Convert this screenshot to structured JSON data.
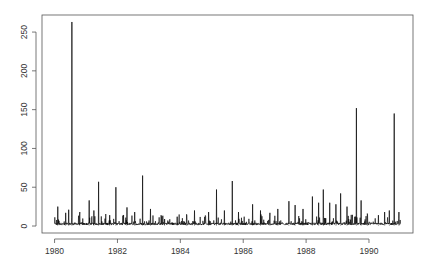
{
  "chart_data": {
    "type": "line",
    "title": "",
    "xlabel": "",
    "ylabel": "",
    "xlim": [
      1979.6,
      1991.4
    ],
    "ylim": [
      -9,
      272
    ],
    "x_ticks": [
      1980,
      1982,
      1984,
      1986,
      1988,
      1990
    ],
    "x_tick_labels": [
      "1980",
      "1982",
      "1984",
      "1986",
      "1988",
      "1990"
    ],
    "y_ticks": [
      0,
      50,
      100,
      150,
      200,
      250
    ],
    "y_tick_labels": [
      "0",
      "50",
      "100",
      "150",
      "200",
      "250"
    ],
    "grid": false,
    "series": [
      {
        "name": "series",
        "color": "#000000",
        "x_range": [
          1980.0,
          1991.0
        ],
        "baseline_typical": 3,
        "peaks": [
          {
            "x": 1980.1,
            "y": 25
          },
          {
            "x": 1980.35,
            "y": 17
          },
          {
            "x": 1980.45,
            "y": 21
          },
          {
            "x": 1980.55,
            "y": 263
          },
          {
            "x": 1980.8,
            "y": 18
          },
          {
            "x": 1981.1,
            "y": 33
          },
          {
            "x": 1981.25,
            "y": 20
          },
          {
            "x": 1981.4,
            "y": 57
          },
          {
            "x": 1981.75,
            "y": 14
          },
          {
            "x": 1981.95,
            "y": 50
          },
          {
            "x": 1982.3,
            "y": 24
          },
          {
            "x": 1982.55,
            "y": 18
          },
          {
            "x": 1982.8,
            "y": 65
          },
          {
            "x": 1983.05,
            "y": 22
          },
          {
            "x": 1983.5,
            "y": 9
          },
          {
            "x": 1983.9,
            "y": 12
          },
          {
            "x": 1984.2,
            "y": 15
          },
          {
            "x": 1984.45,
            "y": 20
          },
          {
            "x": 1984.9,
            "y": 18
          },
          {
            "x": 1985.15,
            "y": 47
          },
          {
            "x": 1985.4,
            "y": 20
          },
          {
            "x": 1985.65,
            "y": 58
          },
          {
            "x": 1985.85,
            "y": 18
          },
          {
            "x": 1986.3,
            "y": 28
          },
          {
            "x": 1986.55,
            "y": 20
          },
          {
            "x": 1986.85,
            "y": 17
          },
          {
            "x": 1987.1,
            "y": 22
          },
          {
            "x": 1987.45,
            "y": 32
          },
          {
            "x": 1987.65,
            "y": 27
          },
          {
            "x": 1987.9,
            "y": 22
          },
          {
            "x": 1988.2,
            "y": 38
          },
          {
            "x": 1988.4,
            "y": 30
          },
          {
            "x": 1988.55,
            "y": 47
          },
          {
            "x": 1988.75,
            "y": 30
          },
          {
            "x": 1988.95,
            "y": 28
          },
          {
            "x": 1989.1,
            "y": 42
          },
          {
            "x": 1989.3,
            "y": 25
          },
          {
            "x": 1989.6,
            "y": 152
          },
          {
            "x": 1989.75,
            "y": 33
          },
          {
            "x": 1989.95,
            "y": 16
          },
          {
            "x": 1990.3,
            "y": 14
          },
          {
            "x": 1990.5,
            "y": 18
          },
          {
            "x": 1990.65,
            "y": 20
          },
          {
            "x": 1990.8,
            "y": 145
          },
          {
            "x": 1990.95,
            "y": 18
          }
        ]
      }
    ]
  }
}
